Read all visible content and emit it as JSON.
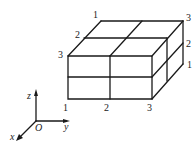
{
  "figure": {
    "vertex_labels": {
      "top_back_left": "1",
      "top_mid_left": "2",
      "top_front_left": "3",
      "back_top_right": "3",
      "right_mid": "2",
      "right_bottom": "1",
      "front_bottom_left": "1",
      "front_bottom_mid": "2",
      "front_bottom_right": "3"
    },
    "axes": {
      "z": "z",
      "y": "y",
      "x": "x",
      "origin": "O"
    },
    "colors": {
      "line": "#1a1a1a",
      "background": "#ffffff"
    }
  }
}
